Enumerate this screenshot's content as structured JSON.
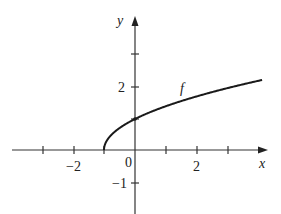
{
  "chart_data": {
    "type": "line",
    "title": "",
    "function_label": "f",
    "expression": "f(x) = sqrt(x + 1)",
    "xlabel": "x",
    "ylabel": "y",
    "xlim": [
      -4,
      4.3
    ],
    "ylim": [
      -2,
      4
    ],
    "x_ticks": [
      -3,
      -2,
      -1,
      0,
      1,
      2,
      3
    ],
    "y_ticks": [
      -1,
      1,
      2,
      3
    ],
    "x_tick_labels": [
      {
        "value": -2,
        "label": "−2"
      },
      {
        "value": 0,
        "label": "0"
      },
      {
        "value": 2,
        "label": "2"
      }
    ],
    "y_tick_labels": [
      {
        "value": 2,
        "label": "2"
      },
      {
        "value": -1,
        "label": "−1"
      }
    ],
    "grid": false,
    "points": [
      {
        "x": -1,
        "y": 0
      },
      {
        "x": 0,
        "y": 1
      },
      {
        "x": 1,
        "y": 1.414
      },
      {
        "x": 2,
        "y": 1.732
      },
      {
        "x": 3,
        "y": 2
      },
      {
        "x": 4,
        "y": 2.236
      }
    ],
    "marked_point": {
      "x": 0,
      "y": 1
    }
  },
  "labels": {
    "x_axis": "x",
    "y_axis": "y",
    "f": "f",
    "tick_neg2": "−2",
    "tick_0": "0",
    "tick_2x": "2",
    "tick_2y": "2",
    "tick_neg1": "−1"
  }
}
